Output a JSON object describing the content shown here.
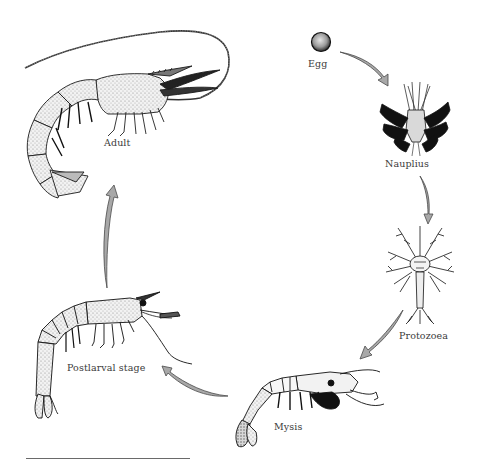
{
  "diagram": {
    "stages": [
      {
        "id": "egg",
        "label": "Egg"
      },
      {
        "id": "nauplius",
        "label": "Nauplius"
      },
      {
        "id": "protozoea",
        "label": "Protozoea"
      },
      {
        "id": "mysis",
        "label": "Mysis"
      },
      {
        "id": "postlarval",
        "label": "Postlarval stage"
      },
      {
        "id": "adult",
        "label": "Adult"
      }
    ],
    "arrows": [
      {
        "from": "Egg",
        "to": "Nauplius"
      },
      {
        "from": "Nauplius",
        "to": "Protozoea"
      },
      {
        "from": "Protozoea",
        "to": "Mysis"
      },
      {
        "from": "Mysis",
        "to": "Postlarval stage"
      },
      {
        "from": "Postlarval stage",
        "to": "Adult"
      }
    ],
    "colors": {
      "arrow_fill": "#a8a8a8",
      "arrow_stroke": "#4a4a4a",
      "ink": "#1a1a1a",
      "stipple": "#cfcfcf",
      "label": "#3a3a3a"
    }
  }
}
